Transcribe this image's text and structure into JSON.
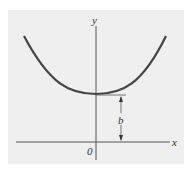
{
  "diagram": {
    "background": "#f0f0f0",
    "curve_color": "#444444",
    "axis_color": "#555555",
    "labels": {
      "y_axis": "y",
      "x_axis": "x",
      "origin": "0",
      "height_marker": "b"
    }
  }
}
